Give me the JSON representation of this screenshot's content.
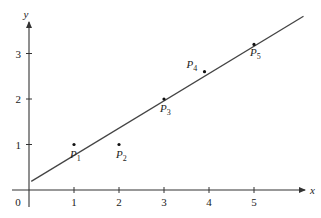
{
  "chart_data": {
    "type": "scatter",
    "title": "",
    "xlabel": "x",
    "ylabel": "y",
    "xlim": [
      0,
      6.2
    ],
    "ylim": [
      0,
      3.8
    ],
    "grid": false,
    "x_ticks": [
      1,
      2,
      3,
      4,
      5
    ],
    "y_ticks": [
      1,
      2,
      3
    ],
    "origin_label": "0",
    "points": [
      {
        "label": "P",
        "sub": "1",
        "x": 1,
        "y": 1
      },
      {
        "label": "P",
        "sub": "2",
        "x": 2,
        "y": 1
      },
      {
        "label": "P",
        "sub": "3",
        "x": 3,
        "y": 2
      },
      {
        "label": "P",
        "sub": "4",
        "x": 3.9,
        "y": 2.6
      },
      {
        "label": "P",
        "sub": "5",
        "x": 5,
        "y": 3.2
      }
    ],
    "fit_line": {
      "slope": 0.6,
      "intercept": 0.16,
      "x_start": 0.05,
      "x_end": 6.1
    }
  },
  "colors": {
    "axis": "#333333",
    "line": "#444444",
    "point": "#111111"
  }
}
